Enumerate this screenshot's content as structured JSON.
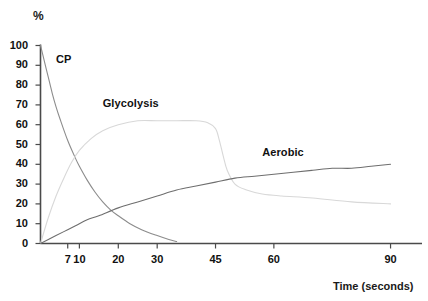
{
  "figure": {
    "cropped_top_text": "",
    "y_axis_title": "%",
    "x_axis_title": "Time (seconds)"
  },
  "chart_data": {
    "type": "line",
    "title": "",
    "xlabel": "Time (seconds)",
    "ylabel": "%",
    "xlim": [
      0,
      95
    ],
    "ylim": [
      0,
      100
    ],
    "grid": false,
    "legend": "inline-labels",
    "xticks": [
      7,
      10,
      20,
      30,
      45,
      60,
      90
    ],
    "xtick_labels": [
      "7",
      "10",
      "20",
      "30",
      "45",
      "60",
      "90"
    ],
    "yticks": [
      0,
      10,
      20,
      30,
      40,
      50,
      60,
      70,
      80,
      90,
      100
    ],
    "ytick_labels": [
      "0",
      "10",
      "20",
      "30",
      "40",
      "50",
      "60",
      "70",
      "80",
      "90",
      "100"
    ],
    "series": [
      {
        "name": "CP",
        "label": "CP",
        "color": "#8c8c8c",
        "x": [
          0,
          1,
          2,
          3,
          4,
          5,
          7,
          9,
          10,
          12,
          14,
          16,
          18,
          20,
          23,
          26,
          30,
          33,
          35
        ],
        "values": [
          100,
          92,
          84,
          76,
          69,
          63,
          52,
          43,
          39,
          32,
          26,
          21,
          17,
          14,
          10,
          7,
          4,
          2,
          1
        ]
      },
      {
        "name": "Glycolysis",
        "label": "Glycolysis",
        "color": "#d8d8d8",
        "x": [
          0,
          2,
          4,
          6,
          8,
          10,
          13,
          16,
          20,
          25,
          30,
          35,
          40,
          43,
          45,
          46,
          47,
          48,
          50,
          53,
          57,
          62,
          70,
          80,
          90
        ],
        "values": [
          0,
          13,
          24,
          33,
          41,
          47,
          53,
          57,
          60,
          62,
          62,
          62,
          62,
          61,
          58,
          52,
          44,
          37,
          30,
          27,
          25,
          24,
          23,
          21,
          20
        ]
      },
      {
        "name": "Aerobic",
        "label": "Aerobic",
        "color": "#6e6e6e",
        "x": [
          0,
          3,
          6,
          9,
          12,
          15,
          20,
          25,
          30,
          35,
          40,
          45,
          50,
          55,
          60,
          65,
          70,
          75,
          80,
          85,
          90
        ],
        "values": [
          0,
          3,
          6,
          9,
          12,
          14,
          18,
          21,
          24,
          27,
          29,
          31,
          33,
          34,
          35,
          36,
          37,
          38,
          38,
          39,
          40
        ]
      }
    ],
    "annotations": [
      {
        "text": "CP",
        "x": 4,
        "y": 92
      },
      {
        "text": "Glycolysis",
        "x": 16,
        "y": 70
      },
      {
        "text": "Aerobic",
        "x": 57,
        "y": 45
      }
    ]
  }
}
